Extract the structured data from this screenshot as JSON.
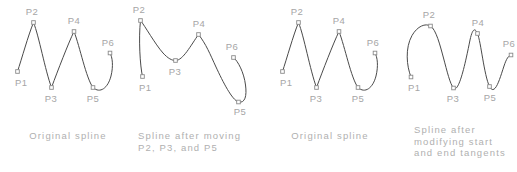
{
  "figure": {
    "width": 517,
    "height": 172,
    "background": "#ffffff",
    "curve_color": "#4a4a4a",
    "label_color": "#a6a6a6",
    "caption_color": "#b0b0b0",
    "marker_color": "#8a8a8a"
  },
  "panels": [
    {
      "id": "panel-original-spline-left",
      "caption": [
        "Original spline"
      ],
      "caption_anchor": "middle",
      "caption_x": 68,
      "caption_y": 139,
      "path": "M 17.5 71.5 C 22 58 28 36 33.5 22.5 C 39 36 45 70 51.5 87.5 C 58 70 68 44 74 31.5 C 80 47 86 78 93 87.5 C 100 94 108 88 111 76 C 113.5 66 112.5 57 110 53",
      "points": [
        {
          "name": "P1",
          "x": 17.5,
          "y": 71.5,
          "label_x": 15,
          "label_y": 86,
          "label_anchor": "start"
        },
        {
          "name": "P2",
          "x": 33.5,
          "y": 22.5,
          "label_x": 32,
          "label_y": 15,
          "label_anchor": "middle"
        },
        {
          "name": "P3",
          "x": 51.5,
          "y": 87.5,
          "label_x": 51,
          "label_y": 102,
          "label_anchor": "middle"
        },
        {
          "name": "P4",
          "x": 74,
          "y": 31.5,
          "label_x": 74,
          "label_y": 24,
          "label_anchor": "middle"
        },
        {
          "name": "P5",
          "x": 93,
          "y": 87.5,
          "label_x": 93,
          "label_y": 102,
          "label_anchor": "middle"
        },
        {
          "name": "P6",
          "x": 110,
          "y": 53,
          "label_x": 108,
          "label_y": 46,
          "label_anchor": "middle"
        }
      ]
    },
    {
      "id": "panel-spline-after-moving",
      "caption": [
        "Spline after moving",
        "P2, P3, and P5"
      ],
      "caption_anchor": "start",
      "caption_x": 138,
      "caption_y": 139,
      "path": "M 142.5 76.5 C 140 66 138.5 38 140.5 20.5 C 145 26 155 44 163 53 C 168 58.5 172 60.5 175.5 60.5 C 183 60.5 191 45 198.5 34.5 C 206 44 210 54 216 67 C 223 82 232 100 238.5 102 C 245 103.5 247 96 245.5 85 C 244 72.5 238 61 233.5 57.5",
      "points": [
        {
          "name": "P1",
          "x": 142.5,
          "y": 76.5,
          "label_x": 139,
          "label_y": 91,
          "label_anchor": "start"
        },
        {
          "name": "P2",
          "x": 140.5,
          "y": 20.5,
          "label_x": 139,
          "label_y": 13,
          "label_anchor": "middle"
        },
        {
          "name": "P3",
          "x": 175.5,
          "y": 60.5,
          "label_x": 175,
          "label_y": 75,
          "label_anchor": "middle"
        },
        {
          "name": "P4",
          "x": 198.5,
          "y": 34.5,
          "label_x": 199,
          "label_y": 27,
          "label_anchor": "middle"
        },
        {
          "name": "P5",
          "x": 238.5,
          "y": 102,
          "label_x": 240,
          "label_y": 115,
          "label_anchor": "middle"
        },
        {
          "name": "P6",
          "x": 233.5,
          "y": 57.5,
          "label_x": 232,
          "label_y": 50,
          "label_anchor": "middle"
        }
      ]
    },
    {
      "id": "panel-original-spline-right",
      "caption": [
        "Original spline"
      ],
      "caption_anchor": "middle",
      "caption_x": 330,
      "caption_y": 139,
      "path": "M 282.5 71.5 C 287 58 293 36 298.5 22.5 C 304 36 310 70 316.5 87.5 C 323 70 333 44 339 31.5 C 345 47 351 78 358 87.5 C 365 94 373 88 376 76 C 378.5 66 377.5 57 375 53",
      "points": [
        {
          "name": "P1",
          "x": 282.5,
          "y": 71.5,
          "label_x": 280,
          "label_y": 86,
          "label_anchor": "start"
        },
        {
          "name": "P2",
          "x": 298.5,
          "y": 22.5,
          "label_x": 297,
          "label_y": 15,
          "label_anchor": "middle"
        },
        {
          "name": "P3",
          "x": 316.5,
          "y": 87.5,
          "label_x": 316,
          "label_y": 102,
          "label_anchor": "middle"
        },
        {
          "name": "P4",
          "x": 339,
          "y": 31.5,
          "label_x": 339,
          "label_y": 24,
          "label_anchor": "middle"
        },
        {
          "name": "P5",
          "x": 358,
          "y": 87.5,
          "label_x": 358,
          "label_y": 102,
          "label_anchor": "middle"
        },
        {
          "name": "P6",
          "x": 375,
          "y": 53,
          "label_x": 373,
          "label_y": 46,
          "label_anchor": "middle"
        }
      ]
    },
    {
      "id": "panel-spline-modified-tangents",
      "caption": [
        "Spline after",
        "modifying start",
        "and end tangents"
      ],
      "caption_anchor": "start",
      "caption_x": 414,
      "caption_y": 133,
      "path": "M 411 77 C 406.5 66 405 48 412 35.5 C 417.5 26 425.5 23 430.5 26 C 436 29.5 440 45 443.5 58 C 447 71 450 84 453.5 88 C 459 94 466 60 470 40 C 472.5 28.5 475 27.5 477.5 33.5 C 481 42 484 75 489.5 86.5 C 495 97 500 78 504 66 C 506.5 58.5 508.5 55.5 511 55",
      "points": [
        {
          "name": "P1",
          "x": 411,
          "y": 77,
          "label_x": 408,
          "label_y": 91,
          "label_anchor": "start"
        },
        {
          "name": "P2",
          "x": 430.5,
          "y": 26,
          "label_x": 429,
          "label_y": 18,
          "label_anchor": "middle"
        },
        {
          "name": "P3",
          "x": 453.5,
          "y": 88,
          "label_x": 453,
          "label_y": 102,
          "label_anchor": "middle"
        },
        {
          "name": "P4",
          "x": 477.5,
          "y": 33.5,
          "label_x": 478,
          "label_y": 26,
          "label_anchor": "middle"
        },
        {
          "name": "P5",
          "x": 489.5,
          "y": 86.5,
          "label_x": 490,
          "label_y": 101,
          "label_anchor": "middle"
        },
        {
          "name": "P6",
          "x": 511,
          "y": 55,
          "label_x": 509,
          "label_y": 47,
          "label_anchor": "middle"
        }
      ]
    }
  ]
}
